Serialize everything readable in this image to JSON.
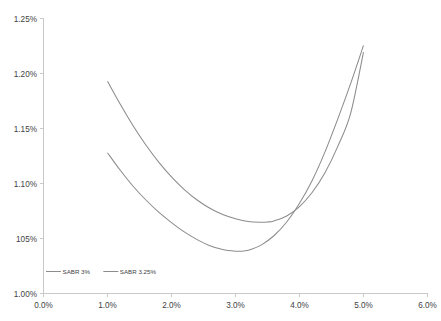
{
  "chart_data": {
    "type": "line",
    "title": "",
    "subtitle": "",
    "xlabel": "",
    "ylabel": "",
    "xlim": [
      0.0,
      6.0
    ],
    "ylim": [
      1.0,
      1.25
    ],
    "x_tick_labels": [
      "0.0%",
      "1.0%",
      "2.0%",
      "3.0%",
      "4.0%",
      "5.0%",
      "6.0%"
    ],
    "x_tick_values": [
      0.0,
      1.0,
      2.0,
      3.0,
      4.0,
      5.0,
      6.0
    ],
    "y_tick_labels": [
      "1.00%",
      "105%",
      "1.10%",
      "1.15%",
      "1.20%",
      "1.25%"
    ],
    "y_tick_values": [
      1.0,
      1.05,
      1.1,
      1.15,
      1.2,
      1.25
    ],
    "grid": false,
    "legend_position": "bottom-left",
    "line_color": "#8c8c8c",
    "axis_color": "#c9c9c9",
    "text_color": "#3f3f3f",
    "series": [
      {
        "name": "SABR 3%",
        "color": "#8c8c8c",
        "x": [
          1.0,
          1.2,
          1.4,
          1.6,
          1.8,
          2.0,
          2.2,
          2.4,
          2.6,
          2.8,
          3.0,
          3.1,
          3.2,
          3.4,
          3.6,
          3.8,
          4.0,
          4.2,
          4.4,
          4.6,
          4.8,
          5.0
        ],
        "y": [
          1.128,
          1.112,
          1.0975,
          1.085,
          1.074,
          1.0645,
          1.056,
          1.049,
          1.0435,
          1.04,
          1.0385,
          1.0385,
          1.0393,
          1.044,
          1.0525,
          1.065,
          1.082,
          1.103,
          1.129,
          1.159,
          1.191,
          1.2255
        ]
      },
      {
        "name": "SABR 3.25%",
        "color": "#8c8c8c",
        "x": [
          1.0,
          1.2,
          1.4,
          1.6,
          1.8,
          2.0,
          2.2,
          2.4,
          2.6,
          2.8,
          3.0,
          3.2,
          3.4,
          3.5,
          3.6,
          3.8,
          4.0,
          4.2,
          4.4,
          4.6,
          4.8,
          5.0
        ],
        "y": [
          1.193,
          1.172,
          1.1525,
          1.135,
          1.1195,
          1.106,
          1.0945,
          1.085,
          1.0775,
          1.0718,
          1.068,
          1.0655,
          1.0648,
          1.065,
          1.066,
          1.0705,
          1.079,
          1.092,
          1.11,
          1.134,
          1.164,
          1.2195
        ]
      }
    ]
  }
}
